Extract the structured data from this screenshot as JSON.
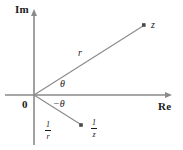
{
  "figure": {
    "width": 183,
    "height": 150,
    "background_color": "#ffffff",
    "line_color": "#8a8a8a",
    "text_color": "#1a1a1a"
  },
  "axes": {
    "imaginary": {
      "label": "Im",
      "orientation": "vertical",
      "arrow": "up"
    },
    "real": {
      "label": "Re",
      "orientation": "horizontal",
      "arrow": "right"
    },
    "origin": {
      "label": "0",
      "x": 34,
      "y": 95
    }
  },
  "points": [
    {
      "name": "z",
      "label": "z",
      "x": 144,
      "y": 25,
      "marker": "filled-square"
    },
    {
      "name": "one-over-z",
      "label_numerator": "1",
      "label_denominator": "z",
      "x": 81,
      "y": 125,
      "marker": "filled-square"
    }
  ],
  "rays": [
    {
      "name": "ray-to-z",
      "length_label": "r",
      "angle_label": "θ"
    },
    {
      "name": "ray-to-one-over-z",
      "length_numerator": "1",
      "length_denominator": "r",
      "angle_label": "−θ"
    }
  ],
  "annotations": {
    "r": "r",
    "theta": "θ",
    "minus_theta": "−θ"
  }
}
